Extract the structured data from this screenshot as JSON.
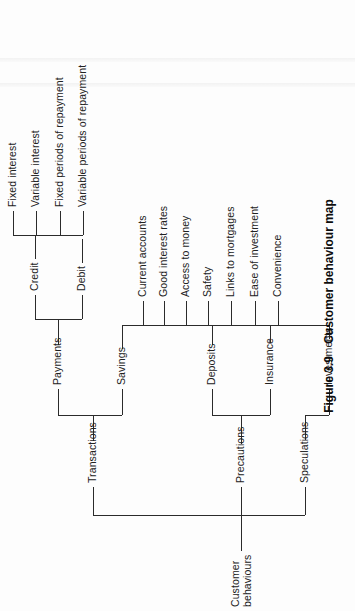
{
  "figure": {
    "caption_label": "Figure 3.9",
    "caption_text": "Customer behaviour map",
    "orientation": "rotated-90-ccw",
    "ink_color": "#2b2b2b",
    "page_color": "#fdfdfd"
  },
  "tree": {
    "root": {
      "id": "customer-behaviours",
      "label_line1": "Customer",
      "label_line2": "behaviours"
    },
    "level1": [
      {
        "id": "transactions",
        "label": "Transactions"
      },
      {
        "id": "precautions",
        "label": "Precautions"
      },
      {
        "id": "speculations",
        "label": "Speculations"
      }
    ],
    "level2": [
      {
        "id": "payments",
        "label": "Payments",
        "parent": "transactions"
      },
      {
        "id": "savings",
        "label": "Savings",
        "parent": "transactions"
      },
      {
        "id": "deposits",
        "label": "Deposits",
        "parent": "precautions"
      },
      {
        "id": "insurance",
        "label": "Insurance",
        "parent": "precautions"
      },
      {
        "id": "investments",
        "label": "Investments",
        "parent": "speculations"
      }
    ],
    "level3": [
      {
        "id": "credit",
        "label": "Credit",
        "parent": "payments"
      },
      {
        "id": "debit",
        "label": "Debit",
        "parent": "payments"
      }
    ],
    "level4_credit": [
      {
        "id": "fixed-interest",
        "label": "Fixed interest"
      },
      {
        "id": "variable-interest",
        "label": "Variable interest"
      },
      {
        "id": "fixed-periods-of-repayment",
        "label": "Fixed periods of repayment"
      },
      {
        "id": "variable-periods-of-repayment",
        "label": "Variable periods of repayment"
      }
    ],
    "attributes": [
      {
        "id": "current-accounts",
        "label": "Current accounts"
      },
      {
        "id": "good-interest-rates",
        "label": "Good interest rates"
      },
      {
        "id": "access-to-money",
        "label": "Access to money"
      },
      {
        "id": "safety",
        "label": "Safety"
      },
      {
        "id": "links-to-mortgages",
        "label": "Links to mortgages"
      },
      {
        "id": "ease-of-investment",
        "label": "Ease of investment"
      },
      {
        "id": "convenience",
        "label": "Convenience"
      }
    ]
  }
}
